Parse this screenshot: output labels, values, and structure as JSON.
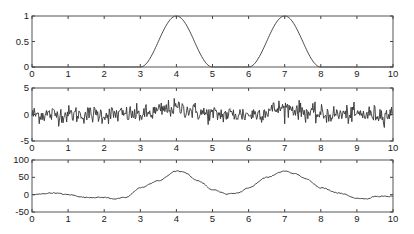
{
  "chart_data": [
    {
      "type": "line",
      "title": "",
      "xlabel": "",
      "ylabel": "",
      "xlim": [
        0,
        10
      ],
      "ylim": [
        0,
        1
      ],
      "xticks": [
        "0",
        "1",
        "2",
        "3",
        "4",
        "5",
        "6",
        "7",
        "8",
        "9",
        "10"
      ],
      "yticks": [
        "0",
        "0.5",
        "1"
      ],
      "grid": false,
      "description": "Two raised-cosine pulses: zero except on [3,5] peaking 1 at x=4 and on [6,8] peaking 1 at x=7",
      "x": [
        0,
        3,
        3.5,
        4,
        4.5,
        5,
        6,
        6.5,
        7,
        7.5,
        8,
        10
      ],
      "y": [
        0,
        0,
        0.5,
        1,
        0.5,
        0,
        0,
        0.5,
        1,
        0.5,
        0,
        0
      ]
    },
    {
      "type": "line",
      "title": "",
      "xlabel": "",
      "ylabel": "",
      "xlim": [
        0,
        10
      ],
      "ylim": [
        -5,
        5
      ],
      "xticks": [
        "0",
        "1",
        "2",
        "3",
        "4",
        "5",
        "6",
        "7",
        "8",
        "9",
        "10"
      ],
      "yticks": [
        "-5",
        "0",
        "5"
      ],
      "grid": false,
      "description": "Noisy signal: pulse signal from panel 1 plus Gaussian noise (std ~1), values mostly within ±2.5",
      "noise_std": 1.0,
      "n_points": 500
    },
    {
      "type": "line",
      "title": "",
      "xlabel": "",
      "ylabel": "",
      "xlim": [
        0,
        10
      ],
      "ylim": [
        -50,
        100
      ],
      "xticks": [
        "0",
        "1",
        "2",
        "3",
        "4",
        "5",
        "6",
        "7",
        "8",
        "9",
        "10"
      ],
      "yticks": [
        "-50",
        "0",
        "50",
        "100"
      ],
      "grid": false,
      "description": "Smoothed / filtered output: slow wave peaking near x=4 and x=7",
      "x": [
        0,
        0.6,
        1.0,
        1.5,
        2.0,
        2.3,
        2.6,
        3.0,
        3.5,
        4.0,
        4.2,
        4.6,
        5.0,
        5.4,
        5.7,
        6.0,
        6.5,
        7.0,
        7.3,
        7.6,
        8.0,
        8.5,
        9.0,
        9.3,
        9.5,
        10.0
      ],
      "y": [
        0,
        5,
        0,
        -8,
        -8,
        -12,
        -8,
        20,
        40,
        68,
        65,
        40,
        15,
        2,
        5,
        20,
        50,
        68,
        60,
        45,
        20,
        5,
        -10,
        -12,
        -5,
        -5
      ]
    }
  ]
}
